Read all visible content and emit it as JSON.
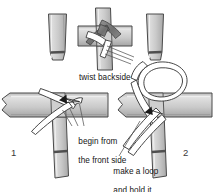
{
  "diagram": {
    "background_color": "#ffffff",
    "strap_fill": "#c8c8c8",
    "strap_fill_light": "#dcdcdc",
    "strap_fill_dark": "#9a9a9a",
    "strap_outline": "#4a4a4a",
    "ribbon_fill": "#ffffff",
    "ribbon_outline": "#3c3c3c",
    "twist_fill": "#7d7d7d",
    "arrow_color": "#222222",
    "text_color": "#141414",
    "labels": {
      "twist_backside": "twist backside",
      "begin_line1": "begin from",
      "begin_line2": "the front side",
      "loop_line1": "make a loop",
      "loop_line2": "and hold it"
    },
    "steps": [
      {
        "number": "1",
        "name": "begin from the front side"
      },
      {
        "number": "2",
        "name": "make a loop and hold it"
      }
    ],
    "inset": {
      "name": "twist backside detail"
    }
  }
}
